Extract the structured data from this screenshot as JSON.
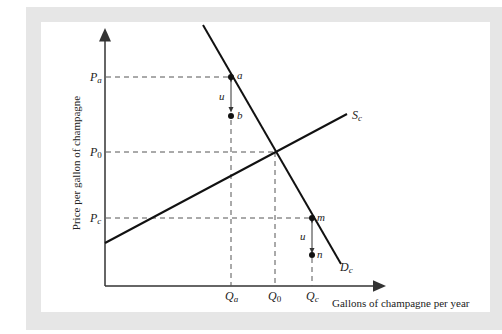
{
  "diagram": {
    "y_axis_label": "Price per gallon of champagne",
    "x_axis_label": "Gallons of champagne per year",
    "price_labels": {
      "pa": {
        "main": "P",
        "sub": "a"
      },
      "p0": {
        "main": "P",
        "sub": "0"
      },
      "pc": {
        "main": "P",
        "sub": "c"
      }
    },
    "quantity_labels": {
      "qa": {
        "main": "Q",
        "sub": "a"
      },
      "q0": {
        "main": "Q",
        "sub": "0"
      },
      "qc": {
        "main": "Q",
        "sub": "c"
      }
    },
    "curves": {
      "supply": {
        "main": "S",
        "sub": "c"
      },
      "demand": {
        "main": "D",
        "sub": "c"
      }
    },
    "points": {
      "a": "a",
      "b": "b",
      "m": "m",
      "n": "n"
    },
    "arrows": {
      "upper_u": "u",
      "lower_u": "u"
    },
    "colors": {
      "line": "#111111",
      "dash": "#555555",
      "frame": "#e6e6e6"
    }
  }
}
